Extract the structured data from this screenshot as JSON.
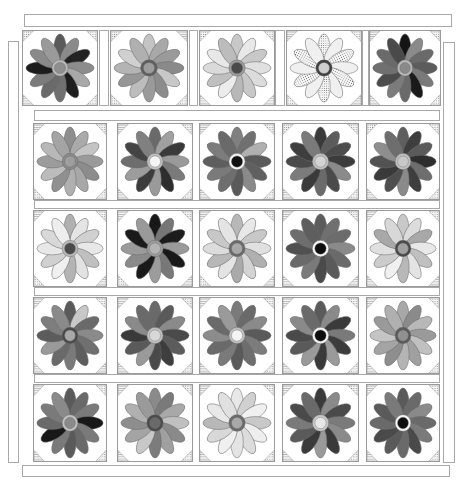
{
  "quilt": {
    "title": "Daisy quilt layout",
    "colors": {
      "border": "#a8a8a8",
      "outline": "#7a7a7a",
      "background": "#ffffff"
    },
    "strips": [
      {
        "name": "top-border",
        "x": 24,
        "y": 14,
        "w": 428,
        "h": 13
      },
      {
        "name": "left-border",
        "x": 8,
        "y": 41,
        "w": 11,
        "h": 422
      },
      {
        "name": "right-border",
        "x": 443,
        "y": 42,
        "w": 12,
        "h": 421
      },
      {
        "name": "bottom-border",
        "x": 22,
        "y": 465,
        "w": 428,
        "h": 12
      },
      {
        "name": "sashing-1",
        "x": 34,
        "y": 110,
        "w": 406,
        "h": 11
      },
      {
        "name": "sashing-2",
        "x": 34,
        "y": 200,
        "w": 406,
        "h": 9
      },
      {
        "name": "sashing-3",
        "x": 34,
        "y": 287,
        "w": 406,
        "h": 9
      },
      {
        "name": "sashing-4",
        "x": 34,
        "y": 374,
        "w": 406,
        "h": 9
      },
      {
        "name": "row1-sash-a",
        "x": 99,
        "y": 30,
        "w": 10,
        "h": 76
      },
      {
        "name": "row1-sash-b",
        "x": 189,
        "y": 30,
        "w": 9,
        "h": 76
      },
      {
        "name": "row1-sash-c",
        "x": 275,
        "y": 30,
        "w": 10,
        "h": 76
      },
      {
        "name": "row1-sash-d",
        "x": 362,
        "y": 30,
        "w": 7,
        "h": 76
      }
    ],
    "rows": [
      {
        "y": 30,
        "h": 76,
        "blocks": [
          {
            "x": 22,
            "w": 76,
            "petals": [
              "#5a5a5a",
              "#8a8a8a",
              "#222",
              "#8c8c8c",
              "#a8a8a8",
              "#1e1e1e",
              "#707070",
              "#6a6a6a",
              "#7c7c7c",
              "#1c1c1c",
              "#8a8a8a",
              "#9a9a9a"
            ],
            "ring": "#b8b8b8",
            "center": "#8e8e8e",
            "corners": [
              "dots",
              "dots",
              "lines",
              "dots"
            ]
          },
          {
            "x": 110,
            "w": 78,
            "petals": [
              "#c4c4c4",
              "#a8a8a8",
              "#9a9a9a",
              "#8a8a8a",
              "#c8c8c8",
              "#8c8c8c",
              "#9a9a9a",
              "#bcbcbc",
              "#969696",
              "#b4b4b4",
              "#d0d0d0",
              "#b0b0b0"
            ],
            "ring": "#5e5e5e",
            "center": "#9c9c9c",
            "corners": [
              "dots",
              "lines",
              "dots",
              "dots"
            ]
          },
          {
            "x": 199,
            "w": 76,
            "petals": [
              "#c8c8c8",
              "#e8e8e8",
              "#c8c8c8",
              "#e0e0e0",
              "#dcdcdc",
              "#c8c8c8",
              "#b8b8b8",
              "#ececec",
              "#c0c0c0",
              "#dadada",
              "#e8e8e8",
              "#bcbcbc"
            ],
            "ring": "#9a9a9a",
            "center": "#4a4a4a",
            "corners": [
              "dots",
              "dots",
              "lines",
              "lines"
            ]
          },
          {
            "x": 286,
            "w": 76,
            "petals": [
              "dots",
              "#f0f0f0",
              "dots",
              "#f0f0f0",
              "dots",
              "#f0f0f0",
              "dots",
              "#f0f0f0",
              "dots",
              "#f0f0f0",
              "dots",
              "#f0f0f0"
            ],
            "ring": "#3e3e3e",
            "center": "#cfcfcf",
            "corners": [
              "lines",
              "dots",
              "dots",
              "lines"
            ]
          },
          {
            "x": 369,
            "w": 72,
            "petals": [
              "#141414",
              "#8a8a8a",
              "#6a6a6a",
              "#5c5c5c",
              "#7a7a7a",
              "#1a1a1a",
              "#6a6a6a",
              "#7c7c7c",
              "#4c4c4c",
              "#707070",
              "#6a6a6a",
              "#4a4a4a"
            ],
            "ring": "#b8b8b8",
            "center": "#8a8a8a",
            "corners": [
              "lines",
              "dots",
              "lines",
              "dots"
            ]
          }
        ]
      },
      {
        "y": 123,
        "h": 77,
        "blocks": [
          {
            "x": 33,
            "w": 74,
            "petals": [
              "#8e8e8e",
              "#aaaaaa",
              "#c4c4c4",
              "#9a9a9a",
              "#8c8c8c",
              "#a8a8a8",
              "#b0b0b0",
              "#909090",
              "#bcbcbc",
              "#9c9c9c",
              "#b8b8b8",
              "#a4a4a4"
            ],
            "ring": "#8a8a8a",
            "center": "#9e9e9e",
            "corners": [
              "lines",
              "dots",
              "dots",
              "dots"
            ]
          },
          {
            "x": 117,
            "w": 76,
            "petals": [
              "#6a6a6a",
              "#a0a0a0",
              "#3a3a3a",
              "#9a9a9a",
              "#7a7a7a",
              "#2e2e2e",
              "#9a9a9a",
              "#3c3c3c",
              "#9c9c9c",
              "#6e6e6e",
              "#444444",
              "#808080"
            ],
            "ring": "#c0c0c0",
            "center": "#f4f4f4",
            "corners": [
              "lines",
              "dots",
              "lines",
              "dots"
            ]
          },
          {
            "x": 199,
            "w": 76,
            "petals": [
              "#808080",
              "#707070",
              "#b0b0b0",
              "#5a5a5a",
              "#606060",
              "#8a8a8a",
              "#5a5a5a",
              "#6e6e6e",
              "#7a7a7a",
              "#5e5e5e",
              "#7c7c7c",
              "#6a6a6a"
            ],
            "ring": "#f4f4f4",
            "center": "#111111",
            "corners": [
              "lines",
              "dots",
              "lines",
              "dots"
            ]
          },
          {
            "x": 282,
            "w": 77,
            "petals": [
              "#3a3a3a",
              "#5c5c5c",
              "#4c4c4c",
              "#3c3c3c",
              "#8a8a8a",
              "#4a4a4a",
              "#6a6a6a",
              "#3a3a3a",
              "#7c7c7c",
              "#4a4a4a",
              "#3e3e3e",
              "#7a7a7a"
            ],
            "ring": "#c0c0c0",
            "center": "#d4d4d4",
            "corners": [
              "dots",
              "dots",
              "lines",
              "dots"
            ]
          },
          {
            "x": 366,
            "w": 74,
            "petals": [
              "#5e5e5e",
              "#3e3e3e",
              "#5a5a5a",
              "#2e2e2e",
              "#6e6e6e",
              "#3e3e3e",
              "#8a8a8a",
              "#4e4e4e",
              "#3a3a3a",
              "#525252",
              "#8e8e8e",
              "#6e6e6e"
            ],
            "ring": "#c0c0c0",
            "center": "#c8c8c8",
            "corners": [
              "dots",
              "dots",
              "lines",
              "dots"
            ]
          }
        ]
      },
      {
        "y": 210,
        "h": 77,
        "blocks": [
          {
            "x": 33,
            "w": 74,
            "petals": [
              "#b0b0b0",
              "#e4e4e4",
              "#d0d0d0",
              "#e8e8e8",
              "#c0c0c0",
              "#e2e2e2",
              "#b4b4b4",
              "#f0f0f0",
              "#d0d0d0",
              "#e8e8e8",
              "#d8d8d8",
              "#eeeeee"
            ],
            "ring": "#b8b8b8",
            "center": "#4a4a4a",
            "corners": [
              "lines",
              "dots",
              "dots",
              "lines"
            ]
          },
          {
            "x": 117,
            "w": 76,
            "petals": [
              "#181818",
              "#767676",
              "#1c1c1c",
              "#9a9a9a",
              "#181818",
              "#787878",
              "#9c9c9c",
              "#1a1a1a",
              "#8a8a8a",
              "#9a9a9a",
              "#1a1a1a",
              "#9a9a9a"
            ],
            "ring": "#9c9c9c",
            "center": "#b4b4b4",
            "corners": [
              "lines",
              "dots",
              "dots",
              "lines"
            ]
          },
          {
            "x": 199,
            "w": 76,
            "petals": [
              "#b8b8b8",
              "#e8e8e8",
              "#c8c8c8",
              "#e0e0e0",
              "#b0b0b0",
              "#d4d4d4",
              "#aaaaaa",
              "#e4e4e4",
              "#b8b8b8",
              "#dcdcdc",
              "#c8c8c8",
              "#e4e4e4"
            ],
            "ring": "#6a6a6a",
            "center": "#a8a8a8",
            "corners": [
              "lines",
              "dots",
              "dots",
              "lines"
            ]
          },
          {
            "x": 282,
            "w": 77,
            "petals": [
              "#5c5c5c",
              "#707070",
              "#6c6c6c",
              "#8a8a8a",
              "#6a6a6a",
              "#5a5a5a",
              "#4a4a4a",
              "#7a7a7a",
              "#6a6a6a",
              "#505050",
              "#6e6e6e",
              "#5e5e5e"
            ],
            "ring": "#f4f4f4",
            "center": "#0e0e0e",
            "corners": [
              "lines",
              "dots",
              "lines",
              "lines"
            ]
          },
          {
            "x": 366,
            "w": 74,
            "petals": [
              "#c8c8c8",
              "#dcdcdc",
              "#a8a8a8",
              "#e8e8e8",
              "#c0c0c0",
              "#e4e4e4",
              "#b8b8b8",
              "#f0f0f0",
              "#cccccc",
              "#e0e0e0",
              "#a8a8a8",
              "#d8d8d8"
            ],
            "ring": "#4a4a4a",
            "center": "#a0a0a0",
            "corners": [
              "lines",
              "dots",
              "lines",
              "lines"
            ]
          }
        ]
      },
      {
        "y": 297,
        "h": 77,
        "blocks": [
          {
            "x": 33,
            "w": 74,
            "petals": [
              "#5a5a5a",
              "#c8c8c8",
              "#6a6a6a",
              "#8a8a8a",
              "#707070",
              "#5e5e5e",
              "#7a7a7a",
              "#6a6a6a",
              "#9a9a9a",
              "#5c5c5c",
              "#7e7e7e",
              "#8a8a8a"
            ],
            "ring": "#4a4a4a",
            "center": "#a8a8a8",
            "corners": [
              "lines",
              "dots",
              "lines",
              "lines"
            ]
          },
          {
            "x": 117,
            "w": 76,
            "petals": [
              "#6a6a6a",
              "#5a5a5a",
              "#8a8a8a",
              "#4a4a4a",
              "#5c5c5c",
              "#3e3e3e",
              "#4a4a4a",
              "#9a9a9a",
              "#5a5a5a",
              "#3a3a3a",
              "#8a8a8a",
              "#6a6a6a"
            ],
            "ring": "#c0c0c0",
            "center": "#d8d8d8",
            "corners": [
              "lines",
              "dots",
              "lines",
              "dots"
            ]
          },
          {
            "x": 199,
            "w": 76,
            "petals": [
              "#7a7a7a",
              "#6a6a6a",
              "#8a8a8a",
              "#5a5a5a",
              "#7c7c7c",
              "#6e6e6e",
              "#5a5a5a",
              "#7a7a7a",
              "#6a6a6a",
              "#8c8c8c",
              "#6a6a6a",
              "#9a9a9a"
            ],
            "ring": "#c0c0c0",
            "center": "#f4f4f4",
            "corners": [
              "lines",
              "dots",
              "lines",
              "dots"
            ]
          },
          {
            "x": 282,
            "w": 77,
            "petals": [
              "#5a5a5a",
              "#8a8a8a",
              "#3a3a3a",
              "#7a7a7a",
              "#3c3c3c",
              "#9a9a9a",
              "#3a3a3a",
              "#9a9a9a",
              "#5a5a5a",
              "#4a4a4a",
              "#8a8a8a",
              "#6a6a6a"
            ],
            "ring": "#f4f4f4",
            "center": "#0e0e0e",
            "corners": [
              "lines",
              "dots",
              "lines",
              "dots"
            ]
          },
          {
            "x": 366,
            "w": 74,
            "petals": [
              "#a8a8a8",
              "#8a8a8a",
              "#b8b8b8",
              "#9a9a9a",
              "#c0c0c0",
              "#a0a0a0",
              "#b4b4b4",
              "#8e8e8e",
              "#a4a4a4",
              "#c4c4c4",
              "#9a9a9a",
              "#b0b0b0"
            ],
            "ring": "#5a5a5a",
            "center": "#909090",
            "corners": [
              "lines",
              "dots",
              "lines",
              "dots"
            ]
          }
        ]
      },
      {
        "y": 384,
        "h": 78,
        "blocks": [
          {
            "x": 33,
            "w": 74,
            "petals": [
              "#5a5a5a",
              "#6a6a6a",
              "#7a7a7a",
              "#181818",
              "#7a7a7a",
              "#6a6a6a",
              "#5a5a5a",
              "#7a7a7a",
              "#181818",
              "#6a6a6a",
              "#7a7a7a",
              "#8a8a8a"
            ],
            "ring": "#c0c0c0",
            "center": "#8a8a8a",
            "corners": [
              "lines",
              "dots",
              "lines",
              "dots"
            ]
          },
          {
            "x": 117,
            "w": 76,
            "petals": [
              "#8a8a8a",
              "#7a7a7a",
              "#a8a8a8",
              "#c0c0c0",
              "#8a8a8a",
              "#a0a0a0",
              "#7c7c7c",
              "#c8c8c8",
              "#a4a4a4",
              "#8e8e8e",
              "#b0b0b0",
              "#9a9a9a"
            ],
            "ring": "#4a4a4a",
            "center": "#6a6a6a",
            "corners": [
              "lines",
              "dots",
              "lines",
              "dots"
            ]
          },
          {
            "x": 199,
            "w": 76,
            "petals": [
              "#e8e8e8",
              "#d0d0d0",
              "#f0f0f0",
              "#c8c8c8",
              "#eeeeee",
              "#dcdcdc",
              "#e4e4e4",
              "#f0f0f0",
              "#d8d8d8",
              "#b8b8b8",
              "#e8e8e8",
              "#e0e0e0"
            ],
            "ring": "#6a6a6a",
            "center": "#a8a8a8",
            "corners": [
              "lines",
              "dots",
              "lines",
              "dots"
            ]
          },
          {
            "x": 282,
            "w": 77,
            "petals": [
              "#3a3a3a",
              "#8a8a8a",
              "#4a4a4a",
              "#7a7a7a",
              "#8a8a8a",
              "#3a3a3a",
              "#9a9a9a",
              "#3a3a3a",
              "#5a5a5a",
              "#7a7a7a",
              "#4a4a4a",
              "#6a6a6a"
            ],
            "ring": "#c8c8c8",
            "center": "#e8e8e8",
            "corners": [
              "lines",
              "dots",
              "lines",
              "dots"
            ]
          },
          {
            "x": 366,
            "w": 74,
            "petals": [
              "#5a5a5a",
              "#6a6a6a",
              "#8a8a8a",
              "#6a6a6a",
              "#7a7a7a",
              "#4a4a4a",
              "#6a6a6a",
              "#5a5a5a",
              "#4a4a4a",
              "#6a6a6a",
              "#5a5a5a",
              "#7a7a7a"
            ],
            "ring": "#f4f4f4",
            "center": "#0e0e0e",
            "corners": [
              "lines",
              "dots",
              "lines",
              "dots"
            ]
          }
        ]
      }
    ]
  }
}
